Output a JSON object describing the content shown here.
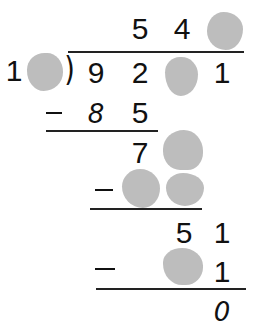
{
  "problem": {
    "type": "long-division",
    "hidden_marker_color": "#bdbdbd",
    "quotient": [
      "5",
      "4",
      "?"
    ],
    "divisor": [
      "1",
      "?"
    ],
    "dividend": [
      "9",
      "2",
      "?",
      "1"
    ],
    "steps": [
      {
        "subtract": [
          "8",
          "5"
        ],
        "remainder_row": [
          "7",
          "?"
        ]
      },
      {
        "subtract": [
          "?",
          "?"
        ],
        "remainder_row": [
          "5",
          "1"
        ]
      },
      {
        "subtract": [
          "?",
          "1"
        ],
        "remainder_row": [
          "0"
        ]
      }
    ]
  },
  "glyphs": {
    "q1": "5",
    "q2": "4",
    "div1": "1",
    "d1": "9",
    "d2": "2",
    "d4": "1",
    "s1a": "8",
    "s1b": "5",
    "r1a": "7",
    "r2a": "5",
    "r2b": "1",
    "s3b": "1",
    "final": "0",
    "paren": ")"
  }
}
